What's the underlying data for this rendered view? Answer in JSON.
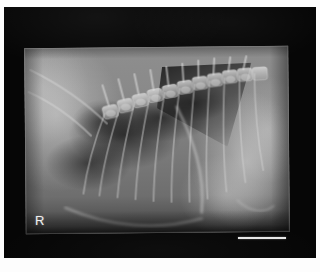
{
  "figure": {
    "kind": "radiograph",
    "modality": "X-ray",
    "view": "lateral",
    "body_region": "thorax-cranial-abdomen"
  },
  "film": {
    "background_color": "#060606",
    "page_margin_color": "#fdfdfd"
  },
  "markers": {
    "laterality": {
      "label": "R",
      "meaning": "right",
      "color": "#efefef"
    },
    "scale_bar": {
      "label": "",
      "color": "#e8e8e8"
    }
  },
  "field": {
    "exposed_field_color": "#7d7d7d",
    "soft_tissue_light": "#d4d4d4",
    "lung_dark": "#1a1a1a"
  },
  "anatomy": {
    "structures": [
      {
        "name": "thoracic-vertebrae",
        "label": "thoracic vertebral column"
      },
      {
        "name": "ribs",
        "label": "rib cage"
      },
      {
        "name": "lung-field",
        "label": "aerated lung field"
      },
      {
        "name": "cardiac-gas-silhouette",
        "label": "cardiac / gas silhouette"
      },
      {
        "name": "diaphragm",
        "label": "diaphragm"
      },
      {
        "name": "liver-abdomen",
        "label": "liver and cranial abdomen"
      },
      {
        "name": "sternum",
        "label": "sternum"
      },
      {
        "name": "scapula-shoulder",
        "label": "scapula and shoulder musculature"
      }
    ]
  }
}
